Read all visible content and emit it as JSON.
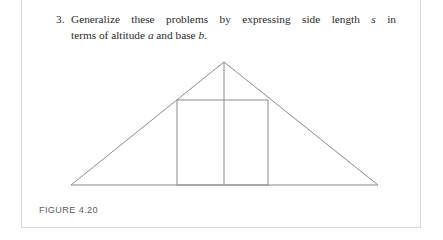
{
  "page": {
    "background_color": "#ffffff",
    "frame_border_color": "#d8d8d8"
  },
  "problem": {
    "number": "3.",
    "line1_prefix": "Generalize these problems by expressing side length ",
    "line1_var": "s",
    "line1_suffix": " in",
    "line2_prefix": "terms of altitude ",
    "line2_var1": "a",
    "line2_middle": " and base ",
    "line2_var2": "b",
    "line2_suffix": ".",
    "full_text": "3. Generalize these problems by expressing side length s in terms of altitude a and base b.",
    "text_color": "#2b2b2b"
  },
  "figure": {
    "caption": "FIGURE 4.20",
    "caption_color": "#5c5c5c",
    "stroke_color": "#8a8a8a",
    "geometry": {
      "triangle_apex": [
        203,
        12
      ],
      "triangle_left_vertex": [
        50,
        135
      ],
      "triangle_right_vertex": [
        357,
        135
      ],
      "square_left": 156,
      "square_right": 247,
      "square_top": 50,
      "square_bottom": 135,
      "altitude_x": 203,
      "altitude_top": 12,
      "altitude_bottom": 135
    }
  }
}
